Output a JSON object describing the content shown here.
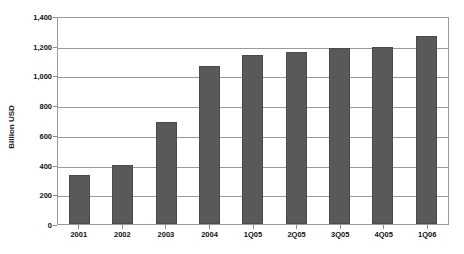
{
  "chart_data": {
    "type": "bar",
    "title": "",
    "xlabel": "",
    "ylabel": "Billion USD",
    "categories": [
      "2001",
      "2002",
      "2003",
      "2004",
      "1Q05",
      "2Q05",
      "3Q05",
      "4Q05",
      "1Q06"
    ],
    "values": [
      330,
      400,
      685,
      1065,
      1140,
      1155,
      1185,
      1190,
      1265
    ],
    "ylim": [
      0,
      1400
    ],
    "yticks": [
      0,
      200,
      400,
      600,
      800,
      1000,
      1200,
      1400
    ],
    "ytick_labels": [
      "0",
      "200",
      "400",
      "600",
      "800",
      "1,000",
      "1,200",
      "1,400"
    ],
    "grid": true,
    "legend": "none",
    "bar_color": "#595959",
    "plot_border_color": "#9a9a9a",
    "gridline_color": "#9a9a9a",
    "background_color": "#ffffff"
  }
}
